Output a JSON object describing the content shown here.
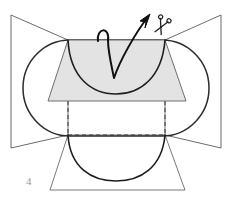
{
  "figure": {
    "label": "4",
    "caption_number": "4",
    "type": "geometric-construction-diagram",
    "colors": {
      "stroke": "#2b2b2b",
      "thin_stroke": "#555555",
      "fill_panel": "#e3e3e3",
      "background": "#ffffff",
      "label_color": "#9a9a9a",
      "dashed": "#3a3a3a"
    },
    "elements": {
      "left_wing_name": "left-wing-quadrilateral",
      "right_wing_name": "right-wing-quadrilateral",
      "stadium_name": "stadium-outline",
      "top_panel_name": "shaded-trapezoid-panel",
      "bottom_panel_name": "bottom-trapezoid",
      "upper_arc_name": "upper-arc",
      "lower_arc_name": "lower-arc",
      "dashed_rect_name": "hidden-edges-dashed",
      "arrow_name": "fold-direction-arrow",
      "scissors_name": "scissors-icon"
    },
    "geometry": {
      "stadium_left_x": 27,
      "stadium_right_x": 205,
      "stadium_top_y": 40,
      "stadium_bottom_y": 136,
      "panel_top_y": 40,
      "panel_bottom_y": 101,
      "panel_top_left_x": 68,
      "panel_top_right_x": 165,
      "panel_bottom_left_x": 48,
      "panel_bottom_right_x": 186,
      "dashed_line_y": 135,
      "bottom_trapezoid_bottom_y": 190,
      "left_edge_x": 11,
      "right_edge_x": 221,
      "wing_top_y": 15,
      "wing_bottom_y": 148,
      "arrow_tip_x": 150,
      "arrow_tip_y": 14,
      "arrow_valley_x": 114,
      "arrow_valley_y": 78,
      "hook_x": 102,
      "hook_y": 28,
      "scissors_x": 161,
      "scissors_y": 27
    }
  }
}
